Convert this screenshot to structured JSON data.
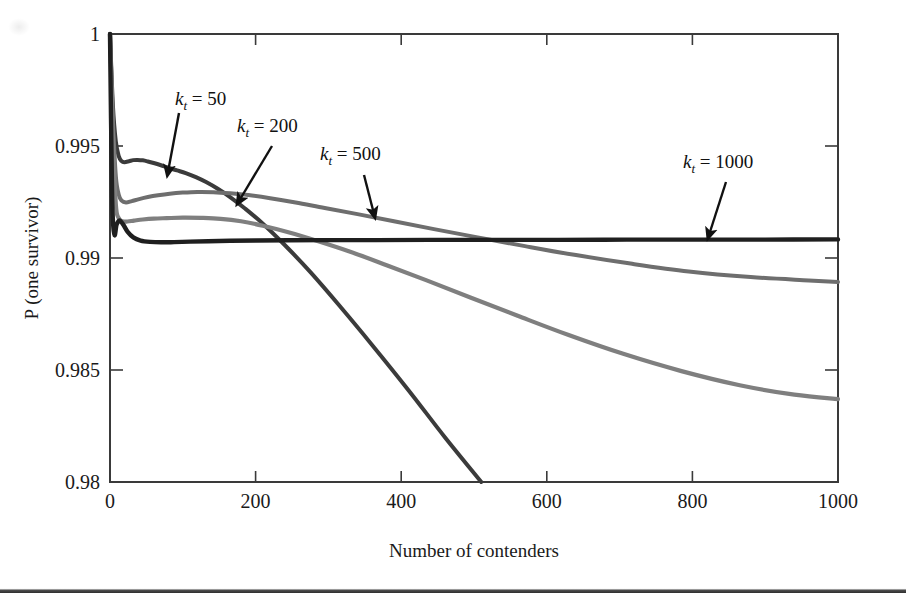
{
  "chart_data": {
    "type": "line",
    "title": "",
    "subtitle": "",
    "xlabel": "Number of contenders",
    "ylabel": "P (one survivor)",
    "xlim": [
      0,
      1000
    ],
    "ylim": [
      0.98,
      1
    ],
    "xticks": [
      0,
      200,
      400,
      600,
      800,
      1000
    ],
    "xtick_labels": [
      "0",
      "200",
      "400",
      "600",
      "800",
      "1000"
    ],
    "yticks": [
      0.98,
      0.985,
      0.99,
      0.995,
      1
    ],
    "ytick_labels": [
      "0.98",
      "0.985",
      "0.99",
      "0.995",
      "1"
    ],
    "grid": false,
    "legend_position": "none",
    "annotations": [
      {
        "id": "kt50",
        "text_prefix": "k",
        "text_subscript": "t",
        "text_suffix": " = 50",
        "full_text": "kt = 50",
        "value": 50,
        "label_x": 175,
        "label_y": 105,
        "arrow_from_x": 179,
        "arrow_from_y": 113,
        "arrow_to_x": 168,
        "arrow_to_y": 172
      },
      {
        "id": "kt200",
        "text_prefix": "k",
        "text_subscript": "t",
        "text_suffix": " = 200",
        "full_text": "kt = 200",
        "value": 200,
        "label_x": 237,
        "label_y": 132,
        "arrow_from_x": 272,
        "arrow_from_y": 146,
        "arrow_to_x": 239,
        "arrow_to_y": 201
      },
      {
        "id": "kt500",
        "text_prefix": "k",
        "text_subscript": "t",
        "text_suffix": " = 500",
        "full_text": "kt = 500",
        "value": 500,
        "label_x": 320,
        "label_y": 160,
        "arrow_from_x": 364,
        "arrow_from_y": 175,
        "arrow_to_x": 374,
        "arrow_to_y": 214
      },
      {
        "id": "kt1000",
        "text_prefix": "k",
        "text_subscript": "t",
        "text_suffix": " = 1000",
        "full_text": "kt = 1000",
        "value": 1000,
        "label_x": 683,
        "label_y": 168,
        "arrow_from_x": 726,
        "arrow_from_y": 182,
        "arrow_to_x": 709,
        "arrow_to_y": 235
      }
    ],
    "series": [
      {
        "name": "kt = 50",
        "color": "#3b3b3b",
        "width": 4.0,
        "x": [
          0,
          4,
          8,
          12,
          16,
          20,
          26,
          32,
          38,
          45,
          52,
          60,
          70,
          80,
          92,
          104,
          118,
          132,
          148,
          165,
          185,
          210,
          240,
          275,
          315,
          360,
          410,
          460,
          510
        ],
        "y": [
          1.0,
          0.9968,
          0.9952,
          0.99455,
          0.99432,
          0.99428,
          0.99432,
          0.99437,
          0.99438,
          0.99436,
          0.99431,
          0.99424,
          0.99414,
          0.99403,
          0.99391,
          0.99379,
          0.99361,
          0.99339,
          0.99309,
          0.99272,
          0.99222,
          0.99153,
          0.99058,
          0.98938,
          0.98788,
          0.98612,
          0.9841,
          0.982,
          0.98
        ]
      },
      {
        "name": "kt = 200",
        "color": "#6e6e6e",
        "width": 4.0,
        "x": [
          0,
          4,
          8,
          12,
          16,
          22,
          30,
          40,
          52,
          66,
          82,
          100,
          120,
          142,
          165,
          190,
          220,
          255,
          295,
          340,
          390,
          445,
          505,
          570,
          640,
          715,
          795,
          880,
          960,
          1000
        ],
        "y": [
          1.0,
          0.9962,
          0.99365,
          0.99283,
          0.99256,
          0.99248,
          0.99254,
          0.99263,
          0.99272,
          0.9928,
          0.99287,
          0.99292,
          0.99295,
          0.99294,
          0.99289,
          0.99281,
          0.99267,
          0.99248,
          0.99223,
          0.99196,
          0.99164,
          0.99129,
          0.99092,
          0.99053,
          0.99013,
          0.98975,
          0.9894,
          0.98915,
          0.989,
          0.98893
        ]
      },
      {
        "name": "kt = 500",
        "color": "#7f7f7f",
        "width": 4.2,
        "x": [
          0,
          4,
          8,
          12,
          17,
          24,
          33,
          45,
          60,
          78,
          100,
          125,
          152,
          180,
          210,
          245,
          285,
          330,
          380,
          435,
          495,
          560,
          630,
          705,
          785,
          865,
          940,
          1000
        ],
        "y": [
          1.0,
          0.9956,
          0.9924,
          0.99178,
          0.99164,
          0.99163,
          0.99167,
          0.99172,
          0.99176,
          0.99178,
          0.9918,
          0.99179,
          0.99175,
          0.99164,
          0.99144,
          0.99115,
          0.99076,
          0.99028,
          0.98968,
          0.989,
          0.98824,
          0.98742,
          0.98656,
          0.98572,
          0.98495,
          0.98432,
          0.9839,
          0.9837
        ]
      },
      {
        "name": "kt = 1000",
        "color": "#1f1f1f",
        "width": 4.4,
        "x": [
          0,
          3,
          6,
          9,
          13,
          18,
          24,
          32,
          42,
          55,
          70,
          88,
          110,
          135,
          165,
          200,
          245,
          300,
          365,
          440,
          525,
          615,
          710,
          805,
          900,
          1000
        ],
        "y": [
          1.0,
          0.99265,
          0.99105,
          0.99148,
          0.99168,
          0.9915,
          0.99118,
          0.99092,
          0.99078,
          0.99072,
          0.9907,
          0.99071,
          0.99073,
          0.99075,
          0.99077,
          0.99078,
          0.99079,
          0.9908,
          0.9908,
          0.99081,
          0.99081,
          0.99081,
          0.99082,
          0.99082,
          0.99082,
          0.99083
        ]
      }
    ]
  },
  "plot_geometry": {
    "left_px": 110,
    "right_px": 838,
    "top_px": 34,
    "bottom_px": 482
  }
}
